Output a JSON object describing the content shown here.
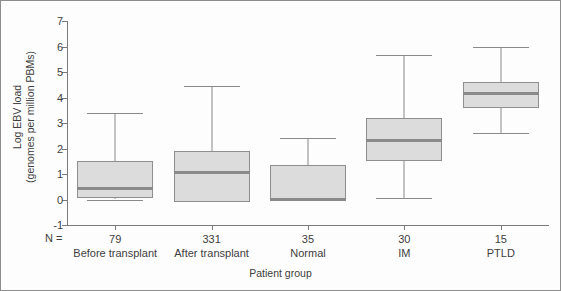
{
  "chart_data": {
    "type": "box",
    "title": "",
    "xlabel": "Patient group",
    "ylabel_line1": "Log EBV load",
    "ylabel_line2": "(genomes per million PBMs)",
    "ylim": [
      -1,
      7
    ],
    "yticks": [
      7,
      6,
      5,
      4,
      3,
      2,
      1,
      0,
      -1
    ],
    "ytick_labels": [
      "7",
      "6",
      "5",
      "4",
      "3",
      "2",
      "1",
      "0",
      "-1"
    ],
    "grid": false,
    "legend": "none",
    "n_prefix": "N =",
    "categories": [
      "Before transplant",
      "After transplant",
      "Normal",
      "IM",
      "PTLD"
    ],
    "counts": [
      "79",
      "331",
      "35",
      "30",
      "15"
    ],
    "boxes": [
      {
        "category": "Before transplant",
        "n": "79",
        "whisker_low": 0.0,
        "q1": 0.05,
        "median": 0.45,
        "q3": 1.5,
        "whisker_high": 3.4
      },
      {
        "category": "After transplant",
        "n": "331",
        "whisker_low": -0.1,
        "q1": -0.1,
        "median": 1.05,
        "q3": 1.9,
        "whisker_high": 4.45
      },
      {
        "category": "Normal",
        "n": "35",
        "whisker_low": 0.0,
        "q1": 0.0,
        "median": 0.0,
        "q3": 1.35,
        "whisker_high": 2.4
      },
      {
        "category": "IM",
        "n": "30",
        "whisker_low": 0.05,
        "q1": 1.5,
        "median": 2.3,
        "q3": 3.2,
        "whisker_high": 5.65
      },
      {
        "category": "PTLD",
        "n": "15",
        "whisker_low": 2.6,
        "q1": 3.6,
        "median": 4.15,
        "q3": 4.6,
        "whisker_high": 6.0
      }
    ],
    "colors": {
      "box_fill": "#dcdcdc",
      "box_stroke": "#8f8f8f",
      "median": "#8a8a8a",
      "whisker": "#8a8a8a",
      "axis": "#7a7a7a",
      "text": "#3e3e3e",
      "background": "#fdfdfd",
      "frame": "#8d8d8d"
    }
  }
}
